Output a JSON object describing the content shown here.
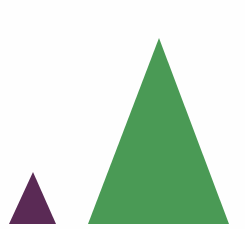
{
  "shapes": [
    {
      "name": "small-triangle",
      "color": "#5a2a55",
      "points": "9,224 33,172 56,224"
    },
    {
      "name": "large-triangle",
      "color": "#4a9a55",
      "points": "88,224 159,38 229,224"
    }
  ]
}
